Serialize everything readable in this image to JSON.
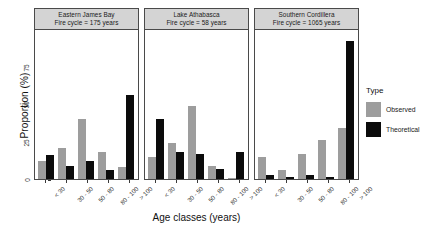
{
  "chart_data": {
    "type": "bar",
    "title": "",
    "xlabel": "Age classes (years)",
    "ylabel": "Proportion (%)",
    "ylim": [
      0,
      100
    ],
    "yticks": [
      0,
      25,
      50,
      75
    ],
    "ytick_labels": [
      "0",
      "25",
      "50",
      "75"
    ],
    "grid": false,
    "legend_position": "right",
    "legend_title": "Type",
    "categories": [
      "< 30",
      "30 - 50",
      "50 - 80",
      "80 - 100",
      "> 100"
    ],
    "series_names": [
      "Observed",
      "Theoretical"
    ],
    "facets": [
      {
        "name": "Eastern James Bay",
        "subtitle": "Fire cycle = 175 years",
        "series": [
          {
            "name": "Observed",
            "values": [
              12,
              21,
              40,
              18,
              8
            ]
          },
          {
            "name": "Theoretical",
            "values": [
              16,
              9,
              12,
              6,
              56
            ]
          }
        ]
      },
      {
        "name": "Lake Athabasca",
        "subtitle": "Fire cycle = 58 years",
        "series": [
          {
            "name": "Observed",
            "values": [
              15,
              24,
              49,
              9,
              1
            ]
          },
          {
            "name": "Theoretical",
            "values": [
              40,
              18,
              17,
              7,
              18
            ]
          }
        ]
      },
      {
        "name": "Southern Cordillera",
        "subtitle": "Fire cycle = 1065 years",
        "series": [
          {
            "name": "Observed",
            "values": [
              15,
              6,
              17,
              26,
              34
            ]
          },
          {
            "name": "Theoretical",
            "values": [
              3,
              1.5,
              3,
              1.5,
              92
            ]
          }
        ]
      }
    ],
    "colors": {
      "observed": "#9d9d9d",
      "theoretical": "#0b0b0b",
      "panel_strip": "#d4d4d4",
      "panel_border": "#4a4a4a",
      "background": "#ffffff"
    }
  }
}
